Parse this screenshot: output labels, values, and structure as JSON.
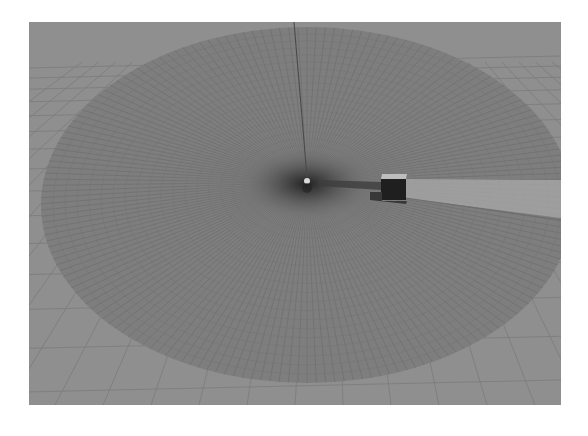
{
  "viewport": {
    "type": "3d-simulation-view",
    "description": "Grayscale 3D scene with a radial laser scan disc around a sensor, a box obstacle casting a scan shadow, and a ground grid"
  },
  "scene": {
    "colors": {
      "background": "#8f8f8f",
      "ground": "#8c8c8c",
      "grid_line": "#7a7a7a",
      "scan_disc": "#7c7c7c",
      "scan_ray": "#6a6a6a",
      "center_shade": "#2e2e2e",
      "axis_line": "#4a4a4a",
      "sensor": "#d8d8d8",
      "obstacle_front": "#1e1e1e",
      "obstacle_top": "#bdbdbd",
      "obstacle_base": "#3a3a3a",
      "shadow_sector": "#a2a2a2"
    },
    "objects": [
      {
        "name": "laser-scan-disc"
      },
      {
        "name": "vertical-axis"
      },
      {
        "name": "lidar-sensor"
      },
      {
        "name": "box-obstacle"
      },
      {
        "name": "scan-shadow-sector"
      },
      {
        "name": "ground-grid"
      }
    ]
  }
}
